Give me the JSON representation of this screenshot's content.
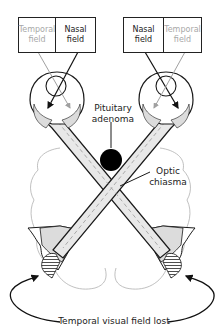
{
  "left_eye_fields": {
    "temporal": "Temporal field",
    "nasal": "Nasal field"
  },
  "right_eye_fields": {
    "nasal": "Nasal field",
    "temporal": "Temporal field"
  },
  "labels": {
    "pituitary_line1": "Pituitary",
    "pituitary_line2": "adenoma",
    "chiasma_line1": "Optic",
    "chiasma_line2": "chiasma",
    "bottom": "Temporal visual field lost"
  },
  "colors": {
    "line": "#1a1a1a",
    "grey_line": "#9a9a9a",
    "nerve_fill": "#e6e6e6",
    "tumor": "#000000",
    "brain_outline": "#b0b0b0"
  }
}
